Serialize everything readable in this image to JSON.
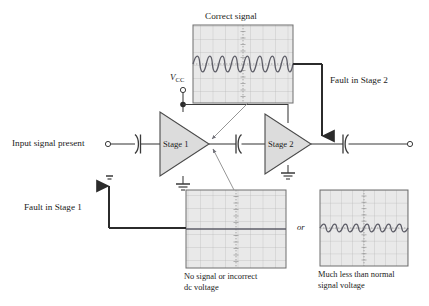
{
  "figure": {
    "type": "two-stage-amplifier-troubleshooting-block-diagram",
    "background": "#ffffff",
    "ink": "#262626",
    "scope_fill": "#e9e9e9",
    "scope_grid": "#b3b3b3",
    "scope_trace": "#5a5a66"
  },
  "labels": {
    "input_terminal": "Input signal present",
    "vcc_symbol": "V",
    "vcc_subscript": "CC",
    "stage1": "Stage 1",
    "stage2": "Stage 2",
    "fault_stage1": "Fault in Stage 1",
    "fault_stage2": "Fault in Stage 2",
    "or_connector": "or"
  },
  "scopes": [
    {
      "id": "correct-signal-scope",
      "caption": "Correct signal",
      "caption_position": "above",
      "waveform": "sine",
      "cycles": 4,
      "amplitude_divs": 1.6,
      "center_offset_divs": 0,
      "grid_cols": 8,
      "grid_rows": 6,
      "box": {
        "x": 193,
        "y": 25,
        "w": 100,
        "h": 78
      }
    },
    {
      "id": "no-signal-scope",
      "caption": "No signal or incorrect dc voltage",
      "caption_line1": "No signal or incorrect",
      "caption_line2": "dc voltage",
      "caption_position": "below",
      "waveform": "flat",
      "cycles": 0,
      "amplitude_divs": 0,
      "center_offset_divs": 0,
      "grid_cols": 8,
      "grid_rows": 6,
      "box": {
        "x": 186,
        "y": 190,
        "w": 100,
        "h": 78
      }
    },
    {
      "id": "low-amplitude-scope",
      "caption": "Much less than normal signal voltage",
      "caption_line1": "Much less than normal",
      "caption_line2": "signal voltage",
      "caption_position": "below",
      "waveform": "sine",
      "cycles": 4,
      "amplitude_divs": 0.85,
      "center_offset_divs": 0,
      "grid_cols": 8,
      "grid_rows": 6,
      "box": {
        "x": 320,
        "y": 190,
        "w": 88,
        "h": 76
      }
    }
  ],
  "circuit": {
    "components": [
      {
        "name": "input-coupling-capacitor",
        "type": "capacitor",
        "orientation": "arc-left"
      },
      {
        "name": "interstage-coupling-capacitor",
        "type": "capacitor",
        "orientation": "arc-right"
      },
      {
        "name": "output-coupling-capacitor",
        "type": "capacitor",
        "orientation": "arc-right"
      },
      {
        "name": "stage1-amplifier",
        "type": "triangle-amplifier"
      },
      {
        "name": "stage2-amplifier",
        "type": "triangle-amplifier"
      },
      {
        "name": "stage1-ground",
        "type": "ground"
      },
      {
        "name": "stage2-ground",
        "type": "ground"
      },
      {
        "name": "fault-stage1-ground",
        "type": "ground"
      },
      {
        "name": "vcc-terminal",
        "type": "open-terminal"
      },
      {
        "name": "vcc-junction",
        "type": "junction-dot"
      },
      {
        "name": "input-terminal",
        "type": "open-terminal"
      },
      {
        "name": "output-terminal",
        "type": "open-terminal"
      }
    ]
  }
}
